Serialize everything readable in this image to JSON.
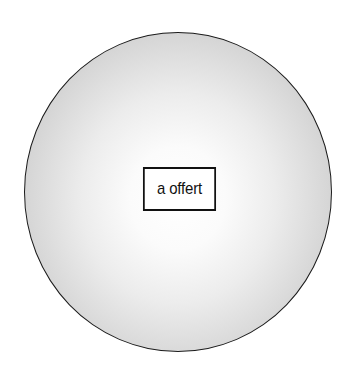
{
  "diagram": {
    "shape": "shaded-sphere",
    "label": "a offert",
    "colors": {
      "outline": "#1a1a1a",
      "center": "#ffffff",
      "edge": "#b9b9b9",
      "label_border": "#111111"
    }
  }
}
